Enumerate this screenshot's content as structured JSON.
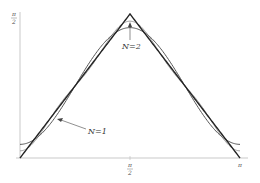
{
  "chart_data": {
    "type": "line",
    "title": "",
    "xlabel": "",
    "ylabel": "",
    "xlim": [
      0,
      3.14159
    ],
    "ylim": [
      0,
      1.5708
    ],
    "x_ticks": [
      {
        "value": 1.5708,
        "label_num": "π",
        "label_den": "2"
      },
      {
        "value": 3.14159,
        "label": "π"
      }
    ],
    "y_ticks": [
      {
        "value": 1.5708,
        "label_num": "π",
        "label_den": "2"
      }
    ],
    "grid": false,
    "series": [
      {
        "name": "f(x) (triangle)",
        "description": "exact function peaking at π/2",
        "color": "#222222"
      },
      {
        "name": "N=1",
        "color": "#555555"
      },
      {
        "name": "N=2",
        "color": "#999999"
      }
    ],
    "annotations": [
      {
        "text": "N=1",
        "arrow_to_x": 0.7,
        "arrow_to_y": 0.56
      },
      {
        "text": "N=2",
        "arrow_to_x": 1.5708,
        "arrow_to_y": 1.45
      }
    ]
  },
  "labels": {
    "n1": "N=1",
    "n2": "N=2",
    "pi": "π",
    "two": "2"
  }
}
